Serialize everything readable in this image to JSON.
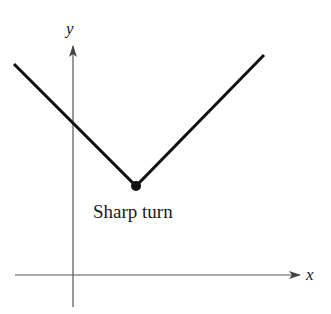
{
  "diagram": {
    "type": "absolute-value-graph",
    "axes": {
      "x_label": "x",
      "y_label": "y"
    },
    "annotation": "Sharp turn",
    "colors": {
      "curve": "#111111",
      "axis": "#555555"
    }
  }
}
